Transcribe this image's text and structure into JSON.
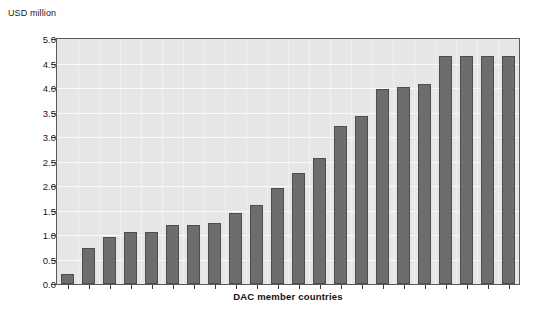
{
  "chart_data": {
    "type": "bar",
    "title": "",
    "subtitle": "",
    "xlabel": "DAC member countries",
    "ylabel": "USD million",
    "ylim": [
      0.0,
      5.0
    ],
    "ytick_labels": [
      "5.0",
      "4.5",
      "4.0",
      "3.5",
      "3.0",
      "2.5",
      "2.0",
      "1.5",
      "1.0",
      "0.5",
      "0.0"
    ],
    "ytick_values": [
      5.0,
      4.5,
      4.0,
      3.5,
      3.0,
      2.5,
      2.0,
      1.5,
      1.0,
      0.5,
      0.0
    ],
    "grid": true,
    "legend": "none",
    "xtick_labels": [],
    "categories": [
      "1",
      "2",
      "3",
      "4",
      "5",
      "6",
      "7",
      "8",
      "9",
      "10",
      "11",
      "12",
      "13",
      "14",
      "15",
      "16",
      "17",
      "18",
      "19",
      "20",
      "21",
      "22"
    ],
    "values": [
      0.2,
      0.73,
      0.95,
      1.06,
      1.06,
      1.2,
      1.2,
      1.25,
      1.45,
      1.62,
      1.96,
      2.26,
      2.58,
      3.23,
      3.42,
      3.97,
      4.02,
      4.08,
      4.65,
      4.65,
      4.65,
      4.65
    ],
    "series": [
      {
        "name": "Contributions",
        "values": [
          0.2,
          0.73,
          0.95,
          1.06,
          1.06,
          1.2,
          1.2,
          1.25,
          1.45,
          1.62,
          1.96,
          2.26,
          2.58,
          3.23,
          3.42,
          3.97,
          4.02,
          4.08,
          4.65,
          4.65,
          4.65,
          4.65
        ]
      }
    ],
    "bar_count": 22,
    "colors": {
      "bar_fill": "#6d6d6d",
      "bar_stroke": "#4d4d4d",
      "plot_background": "#e6e6e6",
      "gridline": "#fbfbfb",
      "axis": "#5a5a5a",
      "text": "#1a1a1a",
      "page_background": "#ffffff"
    }
  }
}
